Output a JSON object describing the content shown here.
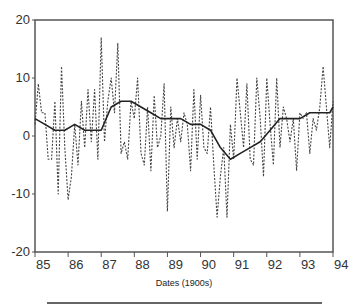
{
  "chart_data": {
    "type": "line",
    "title": "",
    "xlabel": "Dates (1900s)",
    "ylabel": "",
    "xlim": [
      85,
      94
    ],
    "ylim": [
      -20,
      20
    ],
    "xticks": [
      "85",
      "86",
      "87",
      "88",
      "89",
      "90",
      "91",
      "92",
      "93",
      "94"
    ],
    "yticks": [
      "20",
      "10",
      "0",
      "-10",
      "-20"
    ],
    "grid": false,
    "legend": "none",
    "series": [
      {
        "name": "raw (dashed)",
        "style": "dashed",
        "x": [
          85.0,
          85.1,
          85.2,
          85.3,
          85.4,
          85.5,
          85.6,
          85.7,
          85.8,
          85.9,
          86.0,
          86.1,
          86.2,
          86.3,
          86.4,
          86.5,
          86.6,
          86.7,
          86.8,
          86.9,
          87.0,
          87.1,
          87.2,
          87.3,
          87.4,
          87.5,
          87.6,
          87.7,
          87.8,
          87.9,
          88.0,
          88.1,
          88.2,
          88.3,
          88.4,
          88.5,
          88.6,
          88.7,
          88.8,
          88.9,
          89.0,
          89.1,
          89.2,
          89.3,
          89.4,
          89.5,
          89.6,
          89.7,
          89.8,
          89.9,
          90.0,
          90.1,
          90.2,
          90.3,
          90.4,
          90.5,
          90.6,
          90.7,
          90.8,
          90.9,
          91.0,
          91.1,
          91.2,
          91.3,
          91.4,
          91.5,
          91.6,
          91.7,
          91.8,
          91.9,
          92.0,
          92.1,
          92.2,
          92.3,
          92.4,
          92.5,
          92.6,
          92.7,
          92.8,
          92.9,
          93.0,
          93.1,
          93.2,
          93.3,
          93.4,
          93.5,
          93.6,
          93.7,
          93.8,
          93.9,
          94.0
        ],
        "values": [
          2,
          9,
          4,
          4,
          -4,
          -4,
          6,
          -10,
          12,
          -2,
          -11,
          -7,
          2,
          -5,
          6,
          -2,
          8,
          -1,
          8,
          -4,
          17,
          -1,
          6,
          10,
          4,
          16,
          -3,
          -1,
          -4,
          6,
          3,
          10,
          -3,
          -5,
          5,
          -6,
          7,
          -2,
          0,
          9,
          -13,
          5,
          -2,
          3,
          -1,
          4,
          2,
          -6,
          8,
          -4,
          7,
          -2,
          -3,
          5,
          -5,
          -14,
          -7,
          -2,
          -14,
          2,
          -4,
          10,
          4,
          -2,
          9,
          -4,
          -5,
          10,
          3,
          -7,
          10,
          2,
          -5,
          10,
          -2,
          5,
          3,
          -1,
          3,
          -6,
          4,
          3,
          4,
          -3,
          3,
          1,
          5,
          12,
          5,
          -2,
          6
        ]
      },
      {
        "name": "smoothed (solid)",
        "style": "solid",
        "x": [
          85.0,
          85.3,
          85.6,
          85.9,
          86.2,
          86.5,
          86.8,
          87.0,
          87.3,
          87.6,
          87.9,
          88.2,
          88.5,
          88.8,
          89.1,
          89.4,
          89.7,
          90.0,
          90.3,
          90.6,
          90.9,
          91.2,
          91.5,
          91.8,
          92.1,
          92.4,
          92.7,
          93.0,
          93.3,
          93.6,
          93.9,
          94.0
        ],
        "values": [
          3,
          2,
          1,
          1,
          2,
          1,
          1,
          1,
          5,
          6,
          6,
          5,
          4,
          3,
          3,
          3,
          2,
          2,
          1,
          -2,
          -4,
          -3,
          -2,
          -1,
          1,
          3,
          3,
          3,
          4,
          4,
          4,
          5
        ]
      }
    ]
  }
}
